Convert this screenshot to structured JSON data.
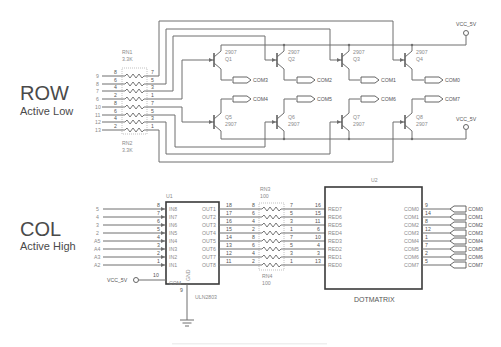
{
  "row_section": {
    "title": "ROW",
    "subtitle": "Active Low",
    "inputs": [
      "9",
      "8",
      "7",
      "6",
      "10",
      "11",
      "12",
      "13"
    ]
  },
  "col_section": {
    "title": "COL",
    "subtitle": "Active High",
    "inputs": [
      "5",
      "4",
      "3",
      "2",
      "A5",
      "A4",
      "A3",
      "A2"
    ]
  },
  "rn1": {
    "name": "RN1",
    "value": "3.3K",
    "left_pins": [
      "8",
      "6",
      "4",
      "2"
    ],
    "right_pins": [
      "7",
      "5",
      "3",
      "1"
    ]
  },
  "rn2": {
    "name": "RN2",
    "value": "3.3K",
    "left_pins": [
      "8",
      "6",
      "4",
      "2"
    ],
    "right_pins": [
      "7",
      "5",
      "3",
      "1"
    ]
  },
  "rn3": {
    "name": "RN3",
    "value": "100",
    "left_pins": [
      "8",
      "6",
      "4",
      "2"
    ],
    "right_pins": [
      "7",
      "5",
      "3",
      "1"
    ]
  },
  "rn4": {
    "name": "RN4",
    "value": "100",
    "left_pins": [
      "8",
      "6",
      "4",
      "2"
    ],
    "right_pins": [
      "7",
      "5",
      "3",
      "1"
    ]
  },
  "transistors": [
    {
      "ref": "Q1",
      "part": "2907"
    },
    {
      "ref": "Q2",
      "part": "2907"
    },
    {
      "ref": "Q3",
      "part": "2907"
    },
    {
      "ref": "Q4",
      "part": "2907"
    },
    {
      "ref": "Q5",
      "part": "2907"
    },
    {
      "ref": "Q6",
      "part": "2907"
    },
    {
      "ref": "Q7",
      "part": "2907"
    },
    {
      "ref": "Q8",
      "part": "2907"
    }
  ],
  "row_ports_top": [
    "COM3",
    "COM2",
    "COM1",
    "COM0"
  ],
  "row_ports_bottom": [
    "COM4",
    "COM5",
    "COM6",
    "COM7"
  ],
  "vcc_label": "VCC_5V",
  "u1": {
    "ref": "U1",
    "part": "ULN2803",
    "in_pins": [
      "8",
      "7",
      "6",
      "5",
      "4",
      "3",
      "2",
      "1"
    ],
    "in_labels": [
      "IN8",
      "IN7",
      "IN6",
      "IN5",
      "IN4",
      "IN3",
      "IN2",
      "IN1"
    ],
    "out_labels": [
      "OUT1",
      "OUT2",
      "OUT3",
      "OUT4",
      "OUT5",
      "OUT6",
      "OUT7",
      "OUT8"
    ],
    "out_pins": [
      "18",
      "17",
      "16",
      "15",
      "14",
      "13",
      "12",
      "11"
    ],
    "com_label": "COM",
    "com_pin": "10",
    "gnd_label": "GND",
    "gnd_pin": "9"
  },
  "u2": {
    "ref": "U2",
    "part": "DOTMATRIX",
    "red_pins": [
      "16",
      "15",
      "11",
      "6",
      "10",
      "4",
      "3",
      "13"
    ],
    "red_labels": [
      "RED7",
      "RED6",
      "RED5",
      "RED4",
      "RED3",
      "RED2",
      "RED1",
      "RED0"
    ],
    "com_labels": [
      "COM0",
      "COM1",
      "COM2",
      "COM3",
      "COM4",
      "COM5",
      "COM6",
      "COM7"
    ],
    "com_pins": [
      "9",
      "14",
      "8",
      "12",
      "1",
      "7",
      "2",
      "5"
    ]
  },
  "col_ports": [
    "COM0",
    "COM1",
    "COM2",
    "COM3",
    "COM4",
    "COM5",
    "COM6",
    "COM7"
  ]
}
